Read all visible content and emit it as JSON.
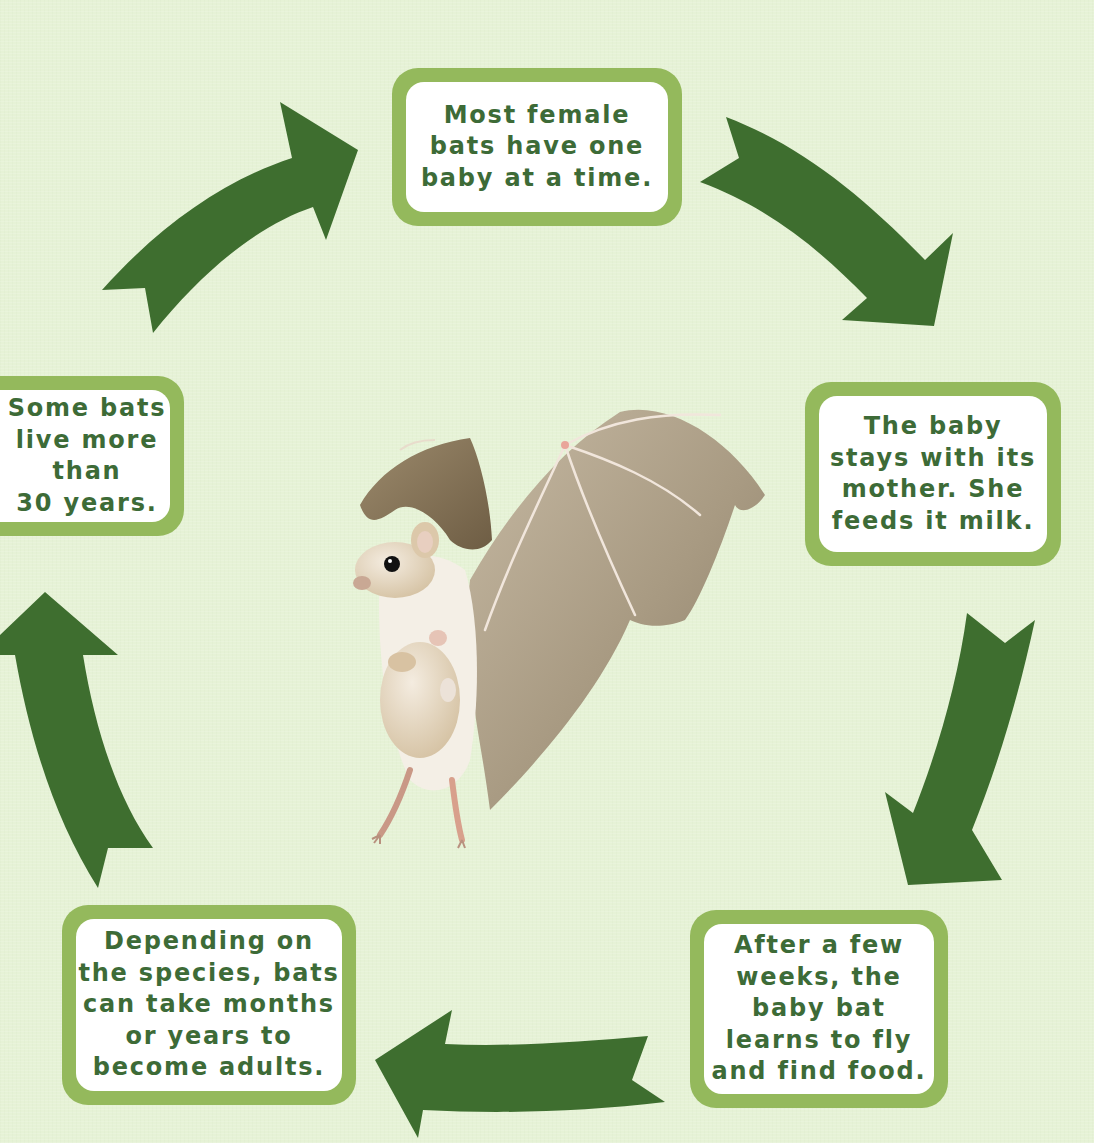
{
  "diagram": {
    "type": "life-cycle",
    "subject": "bat",
    "colors": {
      "background": "#e6f2d6",
      "box_border": "#94b95c",
      "box_fill": "#ffffff",
      "text": "#3d6b37",
      "arrow": "#3e6e2f"
    },
    "stages": [
      {
        "id": "birth",
        "lines": [
          "Most female",
          "bats have one",
          "baby at a time."
        ]
      },
      {
        "id": "nursing",
        "lines": [
          "The baby",
          "stays with its",
          "mother. She",
          "feeds it milk."
        ]
      },
      {
        "id": "flying",
        "lines": [
          "After a few",
          "weeks, the",
          "baby bat",
          "learns to fly",
          "and find food."
        ]
      },
      {
        "id": "maturing",
        "lines": [
          "Depending on",
          "the species, bats",
          "can take months",
          "or years to",
          "become adults."
        ]
      },
      {
        "id": "lifespan",
        "lines": [
          "Some bats",
          "live more",
          "than",
          "30 years."
        ]
      }
    ],
    "arrows": [
      {
        "from": "birth",
        "to": "nursing",
        "direction": "clockwise"
      },
      {
        "from": "nursing",
        "to": "flying",
        "direction": "clockwise"
      },
      {
        "from": "flying",
        "to": "maturing",
        "direction": "clockwise"
      },
      {
        "from": "maturing",
        "to": "lifespan",
        "direction": "clockwise"
      },
      {
        "from": "lifespan",
        "to": "birth",
        "direction": "clockwise"
      }
    ],
    "center_image": "mother bat in flight carrying a baby bat"
  }
}
